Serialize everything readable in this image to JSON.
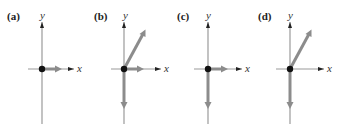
{
  "figure": {
    "panels": [
      {
        "label": "(a)",
        "x_axis": "x",
        "y_axis": "y",
        "vectors": [
          "+x short"
        ]
      },
      {
        "label": "(b)",
        "x_axis": "x",
        "y_axis": "y",
        "vectors": [
          "+x short",
          "-y long",
          "diagonal up-right"
        ]
      },
      {
        "label": "(c)",
        "x_axis": "x",
        "y_axis": "y",
        "vectors": [
          "+x short",
          "-y long"
        ]
      },
      {
        "label": "(d)",
        "x_axis": "x",
        "y_axis": "y",
        "vectors": [
          "-y long",
          "diagonal up-right"
        ]
      }
    ],
    "colors": {
      "axis": "#9a9a9a",
      "vector": "#8c8c8c",
      "dot": "#111111",
      "axis_arrow": "#222222"
    }
  }
}
